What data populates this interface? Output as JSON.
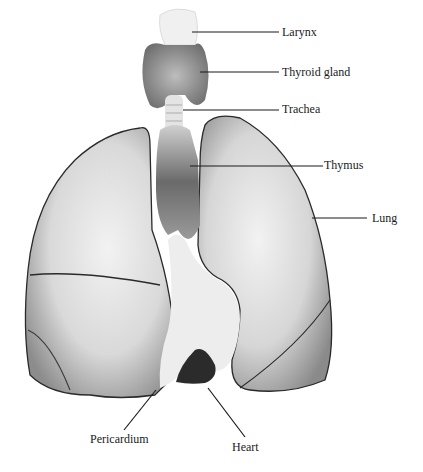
{
  "diagram": {
    "type": "anatomical-illustration",
    "labels": [
      {
        "id": "larynx",
        "text": "Larynx"
      },
      {
        "id": "thyroid",
        "text": "Thyroid gland"
      },
      {
        "id": "trachea",
        "text": "Trachea"
      },
      {
        "id": "thymus",
        "text": "Thymus"
      },
      {
        "id": "lung",
        "text": "Lung"
      },
      {
        "id": "pericardium",
        "text": "Pericardium"
      },
      {
        "id": "heart",
        "text": "Heart"
      }
    ],
    "colors": {
      "background": "#ffffff",
      "organ_fill": "#e6e6e6",
      "organ_shadow": "#7a7a7a",
      "outline": "#2a2a2a",
      "heart": "#2b2b2b",
      "leader_line": "#1a1a1a"
    }
  }
}
